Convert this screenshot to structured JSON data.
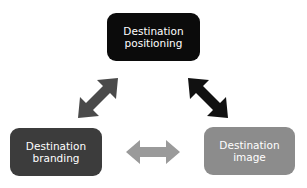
{
  "diagram": {
    "nodes": [
      {
        "id": "positioning",
        "line1": "Destination",
        "line2": "positioning",
        "color": "#0b0b0b"
      },
      {
        "id": "branding",
        "line1": "Destination",
        "line2": "branding",
        "color": "#3c3c3c"
      },
      {
        "id": "image",
        "line1": "Destination",
        "line2": "image",
        "color": "#8c8c8c"
      }
    ],
    "edges": [
      {
        "from": "branding",
        "to": "positioning",
        "type": "bidirectional",
        "color": "#4a4a4a"
      },
      {
        "from": "positioning",
        "to": "image",
        "type": "bidirectional",
        "color": "#111111"
      },
      {
        "from": "branding",
        "to": "image",
        "type": "bidirectional",
        "color": "#9a9a9a"
      }
    ]
  }
}
